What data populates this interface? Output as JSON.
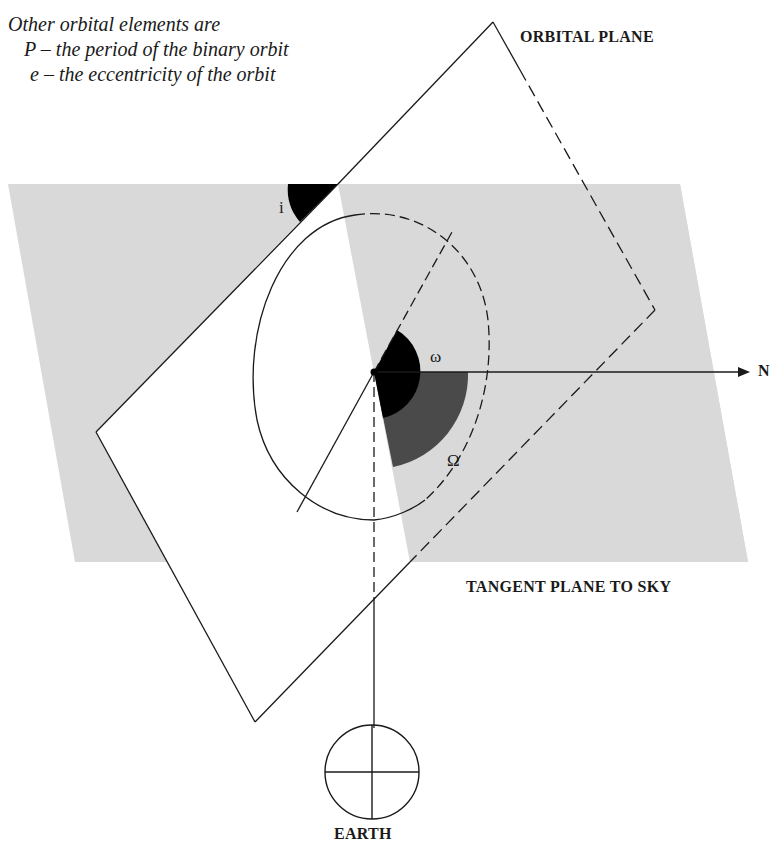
{
  "caption": {
    "heading": "Other orbital elements are",
    "items": [
      "P – the period of the binary orbit",
      "e – the eccentricity of the orbit"
    ]
  },
  "labels": {
    "orbital_plane": "ORBITAL PLANE",
    "tangent_plane": "TANGENT PLANE TO SKY",
    "earth": "EARTH",
    "north": "N",
    "inclination": "i",
    "argument_of_periastron": "ω",
    "longitude_of_node": "Ω"
  },
  "colors": {
    "background": "#ffffff",
    "tangent_plane_fill": "#d9d9d9",
    "orbital_plane_fill": "#ffffff",
    "line": "#1a1a1a",
    "omega_fill": "#000000",
    "Omega_fill": "#4a4a4a",
    "inclination_fill": "#000000"
  }
}
